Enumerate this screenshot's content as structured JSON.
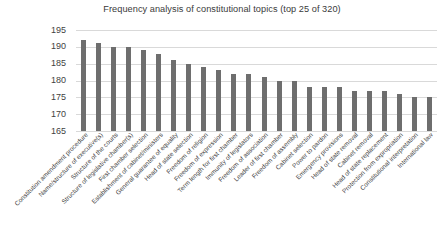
{
  "chart_data": {
    "type": "bar",
    "title": "Frequency analysis of constitutional topics (top 25 of 320)",
    "xlabel": "",
    "ylabel": "",
    "ylim": [
      165,
      195
    ],
    "yticks": [
      165,
      170,
      175,
      180,
      185,
      190,
      195
    ],
    "grid": true,
    "legend": false,
    "bar_color": "#6e6e6e",
    "grid_color": "#d9d9d9",
    "background_color": "#ffffff",
    "text_color": "#3f3f3f",
    "categories": [
      "Constitution amendment procedure",
      "Name/structure of executive(s)",
      "Structure of the courts",
      "Structure of legislative chamber(s)",
      "First chamber selection",
      "Establishment of cabinet/ministers",
      "General guarantee of equality",
      "Head of state selection",
      "Freedom of religion",
      "Freedom of expression",
      "Term length for first chamber",
      "Immunity of legislators",
      "Freedom of association",
      "Leader of first chamber",
      "Freedom of assembly",
      "Cabinet selection",
      "Power to pardon",
      "Emergency provisions",
      "Head of state removal",
      "Cabinet removal",
      "Head of state replacement",
      "Protection from expropriation",
      "Constitutional interpretation",
      "International law"
    ],
    "values": [
      192,
      191,
      190,
      190,
      189,
      188,
      186,
      185,
      184,
      183,
      182,
      182,
      181,
      180,
      180,
      178,
      178,
      178,
      177,
      177,
      177,
      176,
      175,
      175
    ]
  }
}
